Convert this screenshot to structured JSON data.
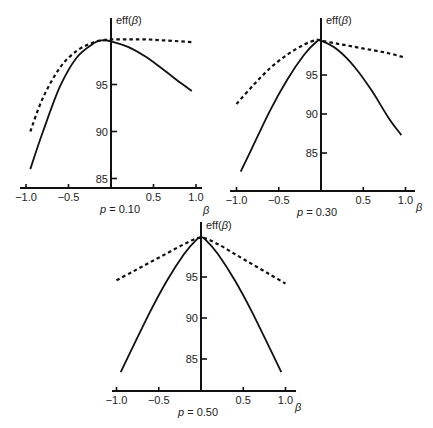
{
  "figure": {
    "panels_count": 3
  },
  "chart_data": [
    {
      "type": "line",
      "title": "p = 0.10",
      "caption": "p = 0.10",
      "p_value": "0.10",
      "xlabel": "β",
      "ylabel": "eff(β)",
      "xlim": [
        -1.0,
        1.0
      ],
      "ylim": [
        84.5,
        100
      ],
      "xticks": [
        -1.0,
        -0.5,
        0.5,
        1.0
      ],
      "xtick_labels": [
        "−1.0",
        "−0.5",
        "0.5",
        "1.0"
      ],
      "yticks": [
        85,
        90,
        95
      ],
      "ytick_labels": [
        "85",
        "90",
        "95"
      ],
      "grid": false,
      "legend": null,
      "layout": {
        "axis_x": 111,
        "axis_y": 188,
        "x_left": 20,
        "x_right": 202,
        "px_per_beta": 85,
        "y_top": 18,
        "y100": 37.5,
        "px_per_unit": 9.4,
        "ylabel_x": 116,
        "ylabel_y": 24,
        "caption_x": 100,
        "caption_y": 213,
        "beta_x": 203,
        "beta_y": 214
      },
      "series": [
        {
          "name": "solid",
          "style": "solid",
          "x": [
            -0.95,
            -0.8,
            -0.6,
            -0.4,
            -0.2,
            -0.1,
            0.0,
            0.2,
            0.4,
            0.6,
            0.8,
            0.95
          ],
          "y": [
            86.0,
            90.0,
            94.8,
            97.9,
            99.4,
            99.7,
            99.6,
            99.0,
            98.0,
            96.7,
            95.3,
            94.3
          ]
        },
        {
          "name": "dashed",
          "style": "dashed",
          "x": [
            -0.95,
            -0.8,
            -0.6,
            -0.4,
            -0.2,
            -0.1,
            0.0,
            0.2,
            0.4,
            0.6,
            0.8,
            0.95
          ],
          "y": [
            90.0,
            93.6,
            96.8,
            98.6,
            99.5,
            99.7,
            99.8,
            99.8,
            99.8,
            99.7,
            99.6,
            99.5
          ]
        }
      ]
    },
    {
      "type": "line",
      "title": "p = 0.30",
      "caption": "p = 0.30",
      "p_value": "0.30",
      "xlabel": "β",
      "ylabel": "eff(β)",
      "xlim": [
        -1.0,
        1.0
      ],
      "ylim": [
        80.5,
        100
      ],
      "xticks": [
        -1.0,
        -0.5,
        0.5,
        1.0
      ],
      "xtick_labels": [
        "−1.0",
        "−0.5",
        "0.5",
        "1.0"
      ],
      "yticks": [
        85,
        90,
        95
      ],
      "yticks_labels_note": "",
      "ytick_labels": [
        "85",
        "90",
        "95"
      ],
      "grid": false,
      "legend": null,
      "layout": {
        "axis_x": 321,
        "axis_y": 191,
        "x_left": 230,
        "x_right": 415,
        "px_per_beta": 84.5,
        "y_top": 18,
        "y100": 36,
        "px_per_unit": 7.8,
        "ylabel_x": 326,
        "ylabel_y": 24,
        "caption_x": 297,
        "caption_y": 216,
        "beta_x": 416,
        "beta_y": 211
      },
      "series": [
        {
          "name": "solid",
          "style": "solid",
          "x": [
            -0.95,
            -0.8,
            -0.6,
            -0.4,
            -0.2,
            -0.05,
            0.0,
            0.2,
            0.4,
            0.6,
            0.8,
            0.95
          ],
          "y": [
            82.6,
            86.0,
            90.5,
            94.4,
            97.6,
            99.3,
            99.4,
            98.2,
            96.0,
            93.0,
            89.5,
            87.3
          ]
        },
        {
          "name": "dashed",
          "style": "dashed",
          "x": [
            -1.0,
            -0.8,
            -0.6,
            -0.4,
            -0.2,
            -0.05,
            0.0,
            0.2,
            0.4,
            0.6,
            0.8,
            0.97
          ],
          "y": [
            91.3,
            93.7,
            95.9,
            97.6,
            98.9,
            99.5,
            99.4,
            99.0,
            98.6,
            98.2,
            97.8,
            97.3
          ]
        }
      ]
    },
    {
      "type": "line",
      "title": "p = 0.50",
      "caption": "p = 0.50",
      "p_value": "0.50",
      "xlabel": "β",
      "ylabel": "eff(β)",
      "xlim": [
        -1.0,
        1.0
      ],
      "ylim": [
        80.5,
        100
      ],
      "xticks": [
        -1.0,
        -0.5,
        0.5,
        1.0
      ],
      "xtick_labels": [
        "−1.0",
        "−0.5",
        "0.5",
        "1.0"
      ],
      "yticks": [
        85,
        90,
        95
      ],
      "ytick_labels": [
        "85",
        "90",
        "95"
      ],
      "grid": false,
      "legend": null,
      "layout": {
        "axis_x": 201,
        "axis_y": 391,
        "x_left": 112,
        "x_right": 296,
        "px_per_beta": 84.5,
        "y_top": 222,
        "y100": 236,
        "px_per_unit": 8.2,
        "ylabel_x": 206,
        "ylabel_y": 229,
        "caption_x": 178,
        "caption_y": 416,
        "beta_x": 295,
        "beta_y": 411
      },
      "series": [
        {
          "name": "solid",
          "style": "solid",
          "x": [
            -0.95,
            -0.8,
            -0.6,
            -0.4,
            -0.2,
            -0.05,
            0.0,
            0.05,
            0.2,
            0.4,
            0.6,
            0.8,
            0.95
          ],
          "y": [
            83.4,
            86.6,
            90.8,
            94.6,
            97.8,
            99.6,
            99.8,
            99.6,
            97.8,
            94.6,
            90.8,
            86.6,
            83.4
          ]
        },
        {
          "name": "dashed",
          "style": "dashed",
          "x": [
            -1.0,
            -0.8,
            -0.6,
            -0.4,
            -0.2,
            0.0,
            0.2,
            0.4,
            0.6,
            0.8,
            1.0
          ],
          "y": [
            94.6,
            95.7,
            96.8,
            97.9,
            99.0,
            99.8,
            99.0,
            97.8,
            96.6,
            95.4,
            94.2
          ]
        }
      ]
    }
  ]
}
